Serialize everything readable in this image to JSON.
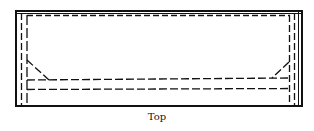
{
  "diagram": {
    "caption": "Top",
    "stroke_color": "#111111",
    "view": "top"
  }
}
